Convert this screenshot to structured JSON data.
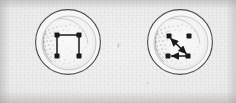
{
  "figure": {
    "caption": "",
    "background_color": "#e9e9e9",
    "ink_color": "#1a1a1a",
    "outline_color": "#4a4a4a",
    "medium": "scanned halftone print",
    "panel_count": 2
  },
  "panels": [
    {
      "id": "left-panel",
      "label": "",
      "circle": {
        "cx": 68,
        "cy": 42,
        "r": 33
      },
      "inner_disc": {
        "cx": 69,
        "cy": 43,
        "r": 27
      },
      "stipple_side": "left",
      "graph": {
        "node_shape": "square",
        "node_size": 5,
        "nodes": [
          {
            "id": "tl",
            "x": 57,
            "y": 35
          },
          {
            "id": "tr",
            "x": 79,
            "y": 35
          },
          {
            "id": "bl",
            "x": 57,
            "y": 56
          },
          {
            "id": "br",
            "x": 79,
            "y": 56
          }
        ],
        "edges": [
          {
            "from": "tl",
            "to": "tr",
            "arrow": "none"
          },
          {
            "from": "tl",
            "to": "bl",
            "arrow": "none"
          },
          {
            "from": "tr",
            "to": "br",
            "arrow": "none"
          }
        ]
      }
    },
    {
      "id": "right-panel",
      "label": "",
      "circle": {
        "cx": 180,
        "cy": 42,
        "r": 33
      },
      "inner_disc": {
        "cx": 181,
        "cy": 43,
        "r": 27
      },
      "stipple_side": "left",
      "graph": {
        "node_shape": "square",
        "node_size": 5,
        "nodes": [
          {
            "id": "tl",
            "x": 169,
            "y": 36
          },
          {
            "id": "tr",
            "x": 189,
            "y": 36
          },
          {
            "id": "bl",
            "x": 168,
            "y": 56
          },
          {
            "id": "br",
            "x": 188,
            "y": 56
          }
        ],
        "edges": [
          {
            "from": "tl",
            "to": "br",
            "arrow": "both"
          },
          {
            "from": "br",
            "to": "bl",
            "arrow": "end"
          }
        ]
      }
    }
  ],
  "marks": [
    {
      "id": "center-speck",
      "x": 118,
      "y": 45,
      "w": 3,
      "h": 4,
      "kind": "ink-speck"
    },
    {
      "id": "lower-speck",
      "x": 147,
      "y": 83,
      "w": 2,
      "h": 2,
      "kind": "ink-speck"
    }
  ]
}
